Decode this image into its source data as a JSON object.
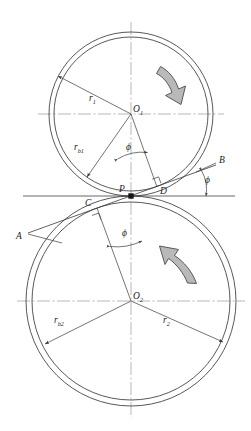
{
  "figure": {
    "type": "engineering-diagram",
    "background_color": "#ffffff",
    "line_color": "#3a3a3a",
    "centerline_color": "#9a9a9a",
    "arrow_fill": "#b9b9b9",
    "arrow_stroke": "#4a4a4a"
  },
  "labels": {
    "center_upper": "O",
    "center_upper_sub": "1",
    "center_lower": "O",
    "center_lower_sub": "2",
    "pitch_point": "P",
    "tangent_point_upper": "D",
    "tangent_point_lower": "C",
    "line_end_upper": "B",
    "line_end_lower": "A",
    "radius_upper": "r",
    "radius_upper_sub": "1",
    "base_radius_upper": "r",
    "base_radius_upper_sub": "b1",
    "radius_lower": "r",
    "radius_lower_sub": "2",
    "base_radius_lower": "r",
    "base_radius_lower_sub": "b2",
    "pressure_angle_upper": "ϕ",
    "pressure_angle_line": "ϕ",
    "pressure_angle_lower": "ϕ"
  },
  "geometry": {
    "axis_x": 131,
    "upper": {
      "cx": 131,
      "cy": 114,
      "pitch_radius": 82,
      "base_radius": 77
    },
    "lower": {
      "cx": 131,
      "cy": 301,
      "pitch_radius": 105,
      "base_radius": 99
    },
    "pitch_point": {
      "x": 131,
      "y": 196
    },
    "pressure_angle_deg": 20,
    "tangent_point_upper": {
      "x": 157,
      "y": 187
    },
    "tangent_point_lower": {
      "x": 97,
      "y": 208
    }
  },
  "rotation": {
    "upper_direction": "clockwise",
    "lower_direction": "counterclockwise"
  }
}
